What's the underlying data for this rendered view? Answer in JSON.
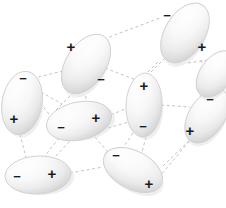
{
  "figure": {
    "background_color": "#ffffff",
    "width": 226,
    "height": 208
  },
  "style": {
    "dash_line_color": "#b4b4b4",
    "dash_line_width": 0.8,
    "dash_pattern": "3,2.6",
    "ellipse_edge_color": "#cfcfcf",
    "ellipse_fill_light": "#ffffff",
    "ellipse_fill_mid": "#f2f2f2",
    "ellipse_fill_dark": "#d2d2d2",
    "charge_text_color": "#1a1a1a"
  },
  "symbols": {
    "positive": "+",
    "negative": "−"
  },
  "dipoles": [
    {
      "id": "dipole-top-right",
      "name": "top-right",
      "cx": 185,
      "cy": 33,
      "rx": 20,
      "ry": 33,
      "rotation": 32,
      "negative": {
        "x": 167,
        "y": 15,
        "size": 13
      },
      "positive": {
        "x": 202,
        "y": 46,
        "size": 15
      }
    },
    {
      "id": "dipole-top-center",
      "name": "top-center",
      "cx": 86,
      "cy": 64,
      "rx": 20,
      "ry": 33,
      "rotation": 33,
      "positive": {
        "x": 71,
        "y": 46,
        "size": 15
      },
      "negative": {
        "x": 101,
        "y": 79,
        "size": 13
      }
    },
    {
      "id": "dipole-left",
      "name": "left",
      "cx": 22,
      "cy": 103,
      "rx": 20,
      "ry": 32,
      "rotation": 10,
      "negative": {
        "x": 23,
        "y": 78,
        "size": 13
      },
      "positive": {
        "x": 14,
        "y": 118,
        "size": 15
      }
    },
    {
      "id": "dipole-center",
      "name": "center",
      "cx": 144,
      "cy": 105,
      "rx": 18,
      "ry": 32,
      "rotation": 3,
      "positive": {
        "x": 144,
        "y": 85,
        "size": 15
      },
      "negative": {
        "x": 143,
        "y": 126,
        "size": 13
      }
    },
    {
      "id": "dipole-center-left",
      "name": "center-left",
      "cx": 79,
      "cy": 121,
      "rx": 33,
      "ry": 19,
      "rotation": -12,
      "negative": {
        "x": 61,
        "y": 127,
        "size": 13
      },
      "positive": {
        "x": 96,
        "y": 117,
        "size": 15
      }
    },
    {
      "id": "dipole-right",
      "name": "right",
      "cx": 207,
      "cy": 116,
      "rx": 18,
      "ry": 30,
      "rotation": 33,
      "negative": {
        "x": 210,
        "y": 99,
        "size": 13
      },
      "positive": {
        "x": 190,
        "y": 130,
        "size": 15
      }
    },
    {
      "id": "dipole-bottom-center",
      "name": "bottom-center",
      "cx": 133,
      "cy": 170,
      "rx": 32,
      "ry": 19,
      "rotation": 28,
      "negative": {
        "x": 116,
        "y": 155,
        "size": 13
      },
      "positive": {
        "x": 149,
        "y": 183,
        "size": 15
      }
    },
    {
      "id": "dipole-bottom-left",
      "name": "bottom-left",
      "cx": 38,
      "cy": 175,
      "rx": 33,
      "ry": 19,
      "rotation": -3,
      "negative": {
        "x": 17,
        "y": 176,
        "size": 13
      },
      "positive": {
        "x": 52,
        "y": 173,
        "size": 15
      }
    },
    {
      "id": "dipole-upper-right-small",
      "name": "upper-right-lower",
      "cx": 216,
      "cy": 74,
      "rx": 16,
      "ry": 26,
      "rotation": 35,
      "negative": null,
      "positive": null
    }
  ],
  "connections": [
    {
      "from": "dipole-top-center",
      "to": "dipole-top-right",
      "x1": 104,
      "y1": 39,
      "x2": 160,
      "y2": 18
    },
    {
      "from": "dipole-top-center",
      "to": "dipole-center",
      "x1": 100,
      "y1": 66,
      "x2": 136,
      "y2": 80
    },
    {
      "from": "dipole-top-center",
      "to": "dipole-left",
      "x1": 63,
      "y1": 71,
      "x2": 38,
      "y2": 77
    },
    {
      "from": "dipole-top-center",
      "to": "dipole-center-left",
      "x1": 86,
      "y1": 96,
      "x2": 85,
      "y2": 106
    },
    {
      "from": "dipole-top-right",
      "to": "dipole-center",
      "x1": 165,
      "y1": 58,
      "x2": 147,
      "y2": 76
    },
    {
      "from": "dipole-top-right",
      "to": "dipole-right",
      "x1": 201,
      "y1": 60,
      "x2": 212,
      "y2": 91
    },
    {
      "from": "dipole-top-right",
      "to": "dipole-upper-right",
      "x1": 188,
      "y1": 63,
      "x2": 208,
      "y2": 60
    },
    {
      "from": "dipole-left",
      "to": "dipole-center-left",
      "x1": 40,
      "y1": 103,
      "x2": 49,
      "y2": 114
    },
    {
      "from": "dipole-left",
      "to": "dipole-bottom-left",
      "x1": 20,
      "y1": 134,
      "x2": 26,
      "y2": 158
    },
    {
      "from": "dipole-center-left",
      "to": "dipole-center",
      "x1": 111,
      "y1": 115,
      "x2": 127,
      "y2": 108
    },
    {
      "from": "dipole-center-left",
      "to": "dipole-bottom-center",
      "x1": 95,
      "y1": 137,
      "x2": 112,
      "y2": 157
    },
    {
      "from": "dipole-center-left",
      "to": "dipole-bottom-left",
      "x1": 59,
      "y1": 138,
      "x2": 44,
      "y2": 157
    },
    {
      "from": "dipole-center",
      "to": "dipole-right",
      "x1": 161,
      "y1": 105,
      "x2": 190,
      "y2": 107
    },
    {
      "from": "dipole-center",
      "to": "dipole-bottom-center",
      "x1": 146,
      "y1": 137,
      "x2": 142,
      "y2": 152
    },
    {
      "from": "dipole-right",
      "to": "dipole-bottom-center",
      "x1": 193,
      "y1": 137,
      "x2": 160,
      "y2": 176
    },
    {
      "from": "dipole-bottom-left",
      "to": "dipole-bottom-center",
      "x1": 70,
      "y1": 173,
      "x2": 103,
      "y2": 167
    },
    {
      "from": "dipole-top-center",
      "to": "dipole-center-left-alt",
      "x1": 74,
      "y1": 92,
      "x2": 56,
      "y2": 110
    },
    {
      "from": "dipole-left",
      "to": "dipole-center-left-alt",
      "x1": 41,
      "y1": 92,
      "x2": 62,
      "y2": 104
    },
    {
      "from": "dipole-top-right",
      "to": "dipole-center-alt",
      "x1": 158,
      "y1": 62,
      "x2": 132,
      "y2": 88
    },
    {
      "from": "dipole-center",
      "to": "dipole-bottom-center-alt",
      "x1": 133,
      "y1": 133,
      "x2": 120,
      "y2": 152
    },
    {
      "from": "dipole-center-left",
      "to": "dipole-center-alt2",
      "x1": 108,
      "y1": 128,
      "x2": 129,
      "y2": 122
    },
    {
      "from": "dipole-upper-right",
      "to": "dipole-right",
      "x1": 213,
      "y1": 86,
      "x2": 212,
      "y2": 93
    },
    {
      "from": "dipole-bottom-left",
      "to": "dipole-center-left-alt2",
      "x1": 52,
      "y1": 160,
      "x2": 72,
      "y2": 139
    },
    {
      "from": "dipole-bottom-center",
      "to": "dipole-right-alt",
      "x1": 163,
      "y1": 166,
      "x2": 196,
      "y2": 134
    }
  ]
}
